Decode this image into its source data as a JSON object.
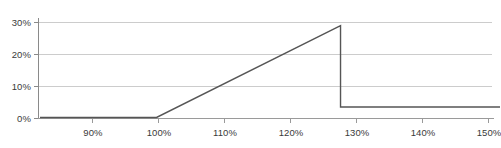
{
  "chart_data": {
    "type": "line",
    "title": "",
    "subtitle": "",
    "xlabel": "",
    "ylabel": "",
    "grid": true,
    "legend": false,
    "legend_position": "none",
    "xlim": [
      81,
      156
    ],
    "ylim": [
      0,
      33
    ],
    "xticks": [
      90,
      100,
      110,
      120,
      130,
      140,
      150
    ],
    "xtick_labels": [
      "90%",
      "100%",
      "110%",
      "120%",
      "130%",
      "140%",
      "150%"
    ],
    "yticks": [
      0,
      10,
      20,
      30
    ],
    "ytick_labels": [
      "0%",
      "10%",
      "20%",
      "30%"
    ],
    "x": [
      81,
      100,
      130,
      130,
      156
    ],
    "values": [
      0,
      0,
      30.5,
      3.5,
      3.5
    ],
    "series": [
      {
        "name": "payoff",
        "color": "#555555",
        "x": [
          81,
          100,
          130,
          130,
          156
        ],
        "values": [
          0,
          0,
          30.5,
          3.5,
          3.5
        ]
      }
    ],
    "annotations": [],
    "colors": {
      "line": "#555555",
      "grid": "#cccccc",
      "axis": "#999999",
      "text": "#3a3a3a",
      "background": "#ffffff"
    }
  }
}
